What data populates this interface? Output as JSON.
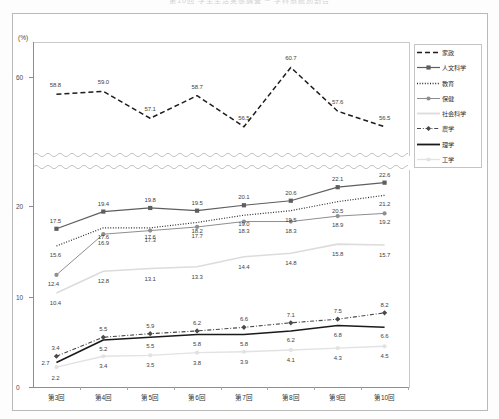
{
  "title_strip": "第10回 学生生活実態調査 ─ 学科系統別割合",
  "axis": {
    "unit_label": "(%)",
    "top_panel_ticks": [
      "60"
    ],
    "bottom_panel_ticks": [
      "20",
      "10",
      "0"
    ]
  },
  "legend": {
    "items": [
      {
        "label": "家政",
        "style": "dashed-nomarker",
        "color": "#1c1c1c"
      },
      {
        "label": "人文科学",
        "style": "solid-marker",
        "color": "#5e5e5e"
      },
      {
        "label": "教育",
        "style": "dotted-nomarker",
        "color": "#2b2b2b"
      },
      {
        "label": "保健",
        "style": "solid-marker",
        "color": "#8b8b8b"
      },
      {
        "label": "社会科学",
        "style": "solid-light",
        "color": "#d8d8d8"
      },
      {
        "label": "農学",
        "style": "dashdot-marker",
        "color": "#4a4a4a"
      },
      {
        "label": "理学",
        "style": "solid-thick",
        "color": "#1a1a1a"
      },
      {
        "label": "工学",
        "style": "solid-verylight",
        "color": "#e0e0e0"
      }
    ]
  },
  "chart_data": {
    "type": "line",
    "title": "第10回 学生生活実態調査 ─ 学科系統別割合",
    "xlabel": "",
    "ylabel": "(%)",
    "grid": false,
    "legend_position": "right",
    "broken_axis": true,
    "categories": [
      "第3回",
      "第4回",
      "第5回",
      "第6回",
      "第7回",
      "第8回",
      "第9回",
      "第10回"
    ],
    "top_panel": {
      "ylim": [
        54.5,
        62.5
      ],
      "ticks": [
        60
      ],
      "series": [
        {
          "name": "家政",
          "values": [
            58.8,
            59.0,
            57.1,
            58.7,
            56.5,
            60.7,
            57.6,
            56.5
          ]
        }
      ]
    },
    "bottom_panel": {
      "ylim": [
        0,
        24
      ],
      "ticks": [
        0,
        10,
        20
      ],
      "series": [
        {
          "name": "人文科学",
          "values": [
            17.5,
            19.4,
            19.8,
            19.5,
            20.1,
            20.6,
            22.1,
            22.6
          ]
        },
        {
          "name": "教育",
          "values": [
            15.6,
            17.6,
            17.6,
            18.2,
            19.0,
            19.5,
            20.5,
            21.2
          ]
        },
        {
          "name": "保健",
          "values": [
            12.4,
            16.9,
            17.3,
            17.7,
            18.3,
            18.3,
            18.9,
            19.2
          ]
        },
        {
          "name": "社会科学",
          "values": [
            10.4,
            12.8,
            13.1,
            13.3,
            14.4,
            14.8,
            15.8,
            15.7
          ]
        },
        {
          "name": "農学",
          "values": [
            3.4,
            5.5,
            5.9,
            6.2,
            6.6,
            7.1,
            7.5,
            8.2
          ]
        },
        {
          "name": "理学",
          "values": [
            2.7,
            5.2,
            5.5,
            5.8,
            5.8,
            6.2,
            6.8,
            6.6
          ]
        },
        {
          "name": "工学",
          "values": [
            2.2,
            3.4,
            3.5,
            3.8,
            3.9,
            4.1,
            4.3,
            4.5
          ]
        }
      ]
    }
  }
}
